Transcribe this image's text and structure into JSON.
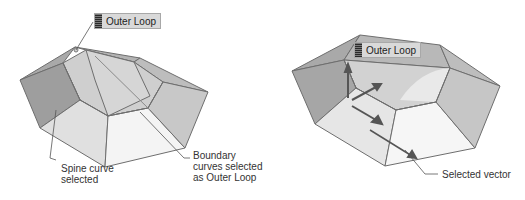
{
  "figure": {
    "left_panel": {
      "badge_label": "Outer Loop",
      "callouts": [
        {
          "id": "spine",
          "text": "Spine curve\nselected"
        },
        {
          "id": "boundary",
          "text": "Boundary\ncurves selected\nas Outer Loop"
        }
      ]
    },
    "right_panel": {
      "badge_label": "Outer Loop",
      "callouts": [
        {
          "id": "vector",
          "text": "Selected vector"
        }
      ]
    },
    "colors": {
      "face_dark": "#9e9e9e",
      "face_mid": "#c4c4c4",
      "face_light": "#e6e6e6",
      "face_lightest": "#f4f4f4",
      "edge": "#6e6e6e",
      "leader": "#555555"
    }
  }
}
